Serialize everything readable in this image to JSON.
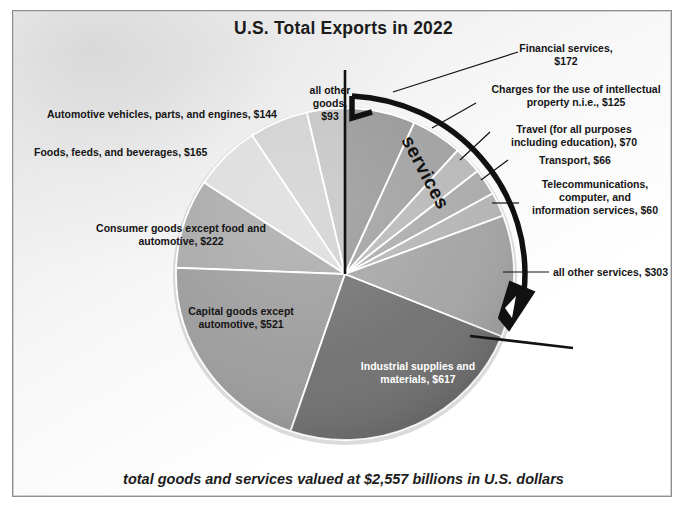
{
  "title": "U.S. Total Exports in 2022",
  "footnote": "total goods and services valued at $2,557 billions in U.S. dollars",
  "group_annotation": "services",
  "colors": {
    "page_background": "#ffffff",
    "frame_border": "#8d8d8d",
    "title_text": "#1b1b1b",
    "leader_line": "#000000",
    "arrow": "#000000",
    "slice_divider": "#ffffff",
    "axis_line": "#000000"
  },
  "chart_data": {
    "type": "pie",
    "title": "U.S. Total Exports in 2022",
    "units": "billions of U.S. dollars",
    "total": 2557,
    "total_label": "$2,557",
    "grid": false,
    "legend": false,
    "label_position": "callout-and-inside",
    "groups": [
      "goods",
      "services"
    ],
    "categories": [
      "all other goods",
      "Automotive vehicles, parts, and engines",
      "Foods, feeds, and beverages",
      "Consumer goods except food and automotive",
      "Capital goods except automotive",
      "Industrial supplies and materials",
      "all other services",
      "Telecommunications, computer, and information services",
      "Transport",
      "Travel (for all purposes including education)",
      "Charges for the use of intellectual property n.i.e.",
      "Financial services"
    ],
    "values": [
      93,
      144,
      165,
      222,
      521,
      617,
      303,
      60,
      66,
      70,
      125,
      172
    ],
    "slices": [
      {
        "name": "all other goods",
        "value": 93,
        "label": "all other\ngoods,\n$93",
        "group": "goods",
        "color": "#c3c3c3"
      },
      {
        "name": "Automotive vehicles, parts, and engines",
        "value": 144,
        "label": "Automotive vehicles, parts, and engines, $144",
        "group": "goods",
        "color": "#d0d0d0"
      },
      {
        "name": "Foods, feeds, and beverages",
        "value": 165,
        "label": "Foods, feeds, and beverages, $165",
        "group": "goods",
        "color": "#dcdcdc"
      },
      {
        "name": "Consumer goods except food and automotive",
        "value": 222,
        "label": "Consumer goods except food and\nautomotive, $222",
        "group": "goods",
        "color": "#a8a8a8"
      },
      {
        "name": "Capital goods except automotive",
        "value": 521,
        "label": "Capital goods except\nautomotive, $521",
        "group": "goods",
        "color": "#9b9b9b"
      },
      {
        "name": "Industrial supplies and materials",
        "value": 617,
        "label": "Industrial supplies and\nmaterials, $617",
        "group": "goods",
        "color": "#6f6f6f"
      },
      {
        "name": "all other services",
        "value": 303,
        "label": "all other services, $303",
        "group": "services",
        "color": "#a3a3a3"
      },
      {
        "name": "Telecommunications, computer, and information services",
        "value": 60,
        "label": "Telecommunications,\ncomputer, and\ninformation services, $60",
        "group": "services",
        "color": "#b4b4b4"
      },
      {
        "name": "Transport",
        "value": 66,
        "label": "Transport, $66",
        "group": "services",
        "color": "#aaaaaa"
      },
      {
        "name": "Travel (for all purposes including education)",
        "value": 70,
        "label": "Travel (for all purposes\nincluding education), $70",
        "group": "services",
        "color": "#b8b8b8"
      },
      {
        "name": "Charges for the use of intellectual property n.i.e.",
        "value": 125,
        "label": "Charges for the use of intellectual\nproperty n.i.e., $125",
        "group": "services",
        "color": "#9f9f9f"
      },
      {
        "name": "Financial services",
        "value": 172,
        "label": "Financial services,\n$172",
        "group": "services",
        "color": "#969696"
      }
    ]
  },
  "callouts": {
    "financial_services": "Financial services,\n$172",
    "ip_charges": "Charges for the use of intellectual\nproperty n.i.e., $125",
    "travel": "Travel (for all purposes\nincluding education), $70",
    "transport": "Transport, $66",
    "telecom": "Telecommunications,\ncomputer, and\ninformation services, $60",
    "all_other_services": "all other services, $303",
    "automotive": "Automotive vehicles, parts, and engines, $144",
    "foods": "Foods, feeds, and beverages, $165",
    "consumer_goods": "Consumer goods except food and\nautomotive, $222",
    "capital_goods": "Capital goods except\nautomotive, $521",
    "industrial": "Industrial supplies and\nmaterials, $617",
    "all_other_goods": "all other\ngoods,\n$93"
  }
}
